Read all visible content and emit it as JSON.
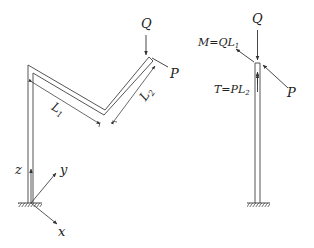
{
  "left_figure": {
    "labels": {
      "Q": "Q",
      "P": "P",
      "L1": "L",
      "L1_sub": "1",
      "L2": "L",
      "L2_sub": "2",
      "z": "z",
      "y": "y",
      "x": "x"
    }
  },
  "right_figure": {
    "labels": {
      "Q": "Q",
      "P": "P",
      "M": "M=QL",
      "M_sub": "1",
      "T": "T=PL",
      "T_sub": "2"
    }
  },
  "colors": {
    "line": "#444444",
    "text": "#222222"
  }
}
